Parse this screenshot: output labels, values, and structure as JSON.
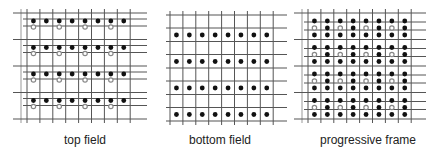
{
  "panels": [
    {
      "id": "top-field",
      "caption": "top field",
      "columns": 8,
      "groups": 4,
      "rows_per_group": [
        "black",
        "grey-alternate"
      ],
      "description": "Top field: black samples on first line of each pair, grey hollow samples at alternate positions below"
    },
    {
      "id": "bottom-field",
      "caption": "bottom field",
      "columns": 8,
      "groups": 4,
      "rows_per_group": [
        "black"
      ],
      "description": "Bottom field: black samples only"
    },
    {
      "id": "progressive-frame",
      "caption": "progressive frame",
      "columns": 8,
      "groups": 4,
      "rows_per_group": [
        "black",
        "grey-alternate-with-black",
        "black"
      ],
      "description": "Progressive frame: all lines, grey hollow chroma samples at alternate positions on middle line"
    }
  ],
  "colors": {
    "grid_line": "#555555",
    "grid_line_light": "#999999",
    "sample_black": "#111111",
    "sample_grey": "#888888"
  }
}
